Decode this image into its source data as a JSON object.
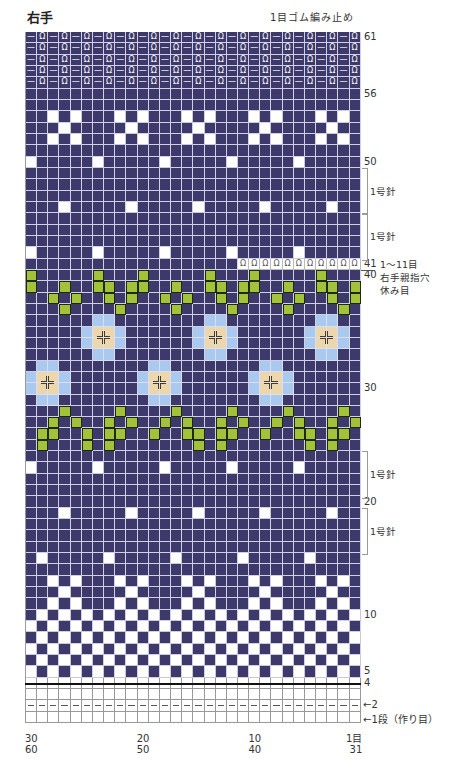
{
  "header": {
    "title": "右手",
    "top_note": "1目ゴム編み止め"
  },
  "chart_data": {
    "type": "knitting-chart",
    "title": "右手",
    "columns": 30,
    "rows": 61,
    "legend_codes": {
      "D": "navy main color",
      "W": "white",
      "G": "green",
      "L": "light blue",
      "B": "beige (flower center)",
      "R": "1x1 rib (knit/purl symbols)",
      "O": "held stitches (thumb hole)",
      "H": "purl row (dash)",
      "E": "empty / knit (white)"
    },
    "colors": {
      "navy": "#3d3a6b",
      "white": "#ffffff",
      "green": "#a3c23a",
      "light_blue": "#a9c9ee",
      "beige": "#ecd7ad"
    },
    "grid_rows_top_to_bottom": [
      "RRRRRRRRRRRRRRRRRRRRRRRRRRRRRR",
      "RRRRRRRRRRRRRRRRRRRRRRRRRRRRRR",
      "RRRRRRRRRRRRRRRRRRRRRRRRRRRRRR",
      "RRRRRRRRRRRRRRRRRRRRRRRRRRRRRR",
      "RRRRRRRRRRRRRRRRRRRRRRRRRRRRRR",
      "DDDDDDDDDDDDDDDDDDDDDDDDDDDDDD",
      "DDDDDDDDDDDDDDDDDDDDDDDDDDDDDD",
      "DDWDWDDDWDWDDDWDWDDDWDWDDDWDWD",
      "DDDWDDDDDWDDDDDWDDDDDWDDDDDWDD",
      "DDWDWDDDWDWDDDWDWDDDWDWDDDWDWD",
      "DDDDDDDDDDDDDDDDDDDDDDDDDDDDDD",
      "WDDDDDWDDDDDWDDDDDWDDDDDWDDDDD",
      "DDDDDDDDDDDDDDDDDDDDDDDDDDDDDD",
      "DDDDDDDDDDDDDDDDDDDDDDDDDDDDDD",
      "DDDDDDDDDDDDDDDDDDDDDDDDDDDDDD",
      "DDDWDDDDDWDDDDDWDDDDDWDDDDDWDD",
      "DDDDDDDDDDDDDDDDDDDDDDDDDDDDDD",
      "DDDDDDDDDDDDDDDDDDDDDDDDDDDDDD",
      "DDDDDDDDDDDDDDDDDDDDDDDDDDDDDD",
      "WDDDDDWDDDDDWDDDDDWDDDDDWDDDDD",
      "DDDDDDDDDDDDDDDDDDDOOOOOOOOOOO",
      "GDDDDDGDDDGDDDDDGDDDGDDDDDGDDD",
      "GDDGDDGGDGGDDGDDGGDGGDDGDDGGDG",
      "DDGDGDDGDGDDGDGDDGDGDDGDGDDGDG",
      "DDDGDDDDGDDDDGDDDDGDDDDGDDDDGD",
      "DDDDDDLLDDDDDDDDLLDDDDDDDDLLDD",
      "DDDDDLBBLDDDDDDLBBLDDDDDDLBBLD",
      "DDDDDLBBLDDDDDDLBBLDDDDDDLBBLD",
      "DDDDDDLLDDDDDDDDLLDDDDDDDDLLDD",
      "DLLDDDDDDDDLLDDDDDDDDLLDDDDDDD",
      "LBBLDDDDDDLBBLDDDDDDLBBLDDDDDD",
      "LBBLDDDDDDLBBLDDDDDDLBBLDDDDDD",
      "DLLDDDDDDDDLLDDDDDDDDLLDDDDDDD",
      "DDDGDDDDGDDDDGDDDDGDDDDGDDDDGD",
      "DDGDGDDGDGDDGDGDDGDGDDGDGDDGDG",
      "DGGDDGDGGDDGDDGGDGGDDGDDGGDGGD",
      "DGDDDGDGDDDDDDDGDGDDDDDDDGDGDD",
      "DDDDDDDDDDDDDDDDDDDDDDDDDDDDDD",
      "WDDDDDWDDDDDWDDDDDWDDDDDWDDDDD",
      "DDDDDDDDDDDDDDDDDDDDDDDDDDDDDD",
      "DDDDDDDDDDDDDDDDDDDDDDDDDDDDDD",
      "DDDDDDDDDDDDDDDDDDDDDDDDDDDDDD",
      "DDDWDDDDDWDDDDDWDDDDDWDDDDDWDD",
      "DDDDDDDDDDDDDDDDDDDDDDDDDDDDDD",
      "DDDDDDDDDDDDDDDDDDDDDDDDDDDDDD",
      "DDDDDDDDDDDDDDDDDDDDDDDDDDDDDD",
      "DWDDDDDWDDDDDWDDDDDWDDDDDWDDDD",
      "DDDDDDDDDDDDDDDDDDDDDDDDDDDDDD",
      "DDWDWDDDWDWDDDWDWDDDWDWDDDWDWD",
      "DDDWDDDDDWDDDDDWDDDDDWDDDDDWDD",
      "DDWDWDDDWDWDDDWDWDDDWDWDDDWDWD",
      "DWDWDWDWDWDWDWDWDWDWDWDWDWDWDW",
      "WDWDWDWDWDWDWDWDWDWDWDWDWDWDWD",
      "DWDWDWDWDWDWDWDWDWDWDWDWDWDWDW",
      "WDWDWDWDWDWDWDWDWDWDWDWDWDWDWD",
      "DWDWDWDWDWDWDWDWDWDWDWDWDWDWDW",
      "WDWDWDWDWDWDWDWDWDWDWDWDWDWDWD",
      "HHHHHHHHHHHHHHHHHHHHHHHHHHHHHH",
      "EEEEEEEEEEEEEEEEEEEEEEEEEEEEEE",
      "HHHHHHHHHHHHHHHHHHHHHHHHHHHHHH",
      "EEEEEEEEEEEEEEEEEEEEEEEEEEEEEE"
    ],
    "row_labels": [
      {
        "row": 61,
        "text": "61"
      },
      {
        "row": 56,
        "text": "56"
      },
      {
        "row": 50,
        "text": "50"
      },
      {
        "row": 41,
        "text": "41"
      },
      {
        "row": 40,
        "text": "40"
      },
      {
        "row": 30,
        "text": "30"
      },
      {
        "row": 20,
        "text": "20"
      },
      {
        "row": 10,
        "text": "10"
      },
      {
        "row": 5,
        "text": "5"
      },
      {
        "row": 4,
        "text": "4"
      },
      {
        "row": 2,
        "text": "←2"
      },
      {
        "row": 1,
        "text": "←1段（作り目）"
      }
    ],
    "brackets": [
      {
        "from_row": 49,
        "to_row": 46,
        "text": "1号針"
      },
      {
        "from_row": 45,
        "to_row": 42,
        "text": "1号針"
      },
      {
        "from_row": 24,
        "to_row": 21,
        "text": "1号針"
      },
      {
        "from_row": 19,
        "to_row": 16,
        "text": "1号針"
      }
    ],
    "annotations": [
      {
        "text": "1〜11目"
      },
      {
        "text": "右手親指穴"
      },
      {
        "text": "休み目"
      }
    ],
    "x_labels": [
      {
        "col": 30,
        "top": "30",
        "bottom": "60"
      },
      {
        "col": 20,
        "top": "20",
        "bottom": "50"
      },
      {
        "col": 10,
        "top": "10",
        "bottom": "40"
      },
      {
        "col": 1,
        "top": "1目",
        "bottom": "31"
      }
    ]
  }
}
